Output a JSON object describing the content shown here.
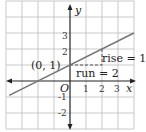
{
  "chart_data": {
    "type": "line",
    "title": "",
    "xlabel": "x",
    "ylabel": "y",
    "xlim": [
      -4,
      4
    ],
    "ylim": [
      -3,
      5
    ],
    "grid": true,
    "x_ticks": [
      "1",
      "2",
      "3"
    ],
    "y_ticks": [
      "3",
      "2",
      "-1",
      "-2"
    ],
    "origin_label": "O",
    "series": [
      {
        "name": "line",
        "slope": 0.5,
        "intercept": 1,
        "x": [
          -3.8,
          4
        ],
        "y": [
          -0.9,
          3
        ]
      }
    ],
    "annotations": {
      "point": "(0, 1)",
      "rise": "rise = 1",
      "run": "run = 2"
    },
    "colors": {
      "line": "#777777",
      "grid": "#bbbbbb",
      "axis": "#222222",
      "triangle": "#555555"
    }
  }
}
